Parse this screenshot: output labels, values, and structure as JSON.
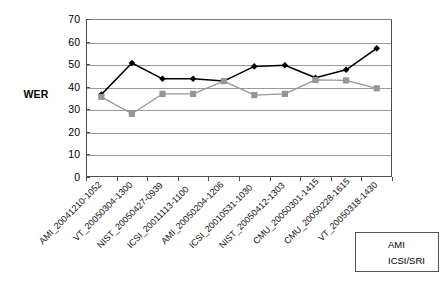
{
  "chart_data": {
    "type": "line",
    "title": "",
    "xlabel": "",
    "ylabel": "WER",
    "ylim": [
      0,
      70
    ],
    "ytick_step": 10,
    "yticks": [
      70,
      60,
      50,
      40,
      30,
      20,
      10,
      0
    ],
    "grid": true,
    "legend_position": "bottom-right",
    "categories": [
      "AMI_20041210-1052",
      "VT_20050304-1300",
      "NIST_20050427-0939",
      "ICSI_20011113-1100",
      "AMI_20050204-1206",
      "ICSI_20010531-1030",
      "NIST_20050412-1303",
      "CMU_20050301-1415",
      "CMU_20050228-1615",
      "VT_20050318-1430"
    ],
    "series": [
      {
        "name": "AMI",
        "color": "#000000",
        "marker": "diamond",
        "values": [
          36.5,
          50.5,
          43.5,
          43.5,
          42.5,
          49.0,
          49.5,
          44.0,
          47.5,
          57.0
        ]
      },
      {
        "name": "ICSI/SRI",
        "color": "#969696",
        "marker": "square",
        "values": [
          35.5,
          28.0,
          36.8,
          36.8,
          42.5,
          36.3,
          36.8,
          43.0,
          42.8,
          39.3
        ]
      }
    ]
  },
  "axis": {
    "y_title": "WER"
  },
  "legend": {
    "entries": [
      {
        "label": "AMI"
      },
      {
        "label": "ICSI/SRI"
      }
    ]
  },
  "colors": {
    "series_ami": "#000000",
    "series_icsi_sri": "#969696",
    "gridline": "#9a9a9a",
    "axis": "#4d4d4d",
    "background": "#ffffff"
  }
}
